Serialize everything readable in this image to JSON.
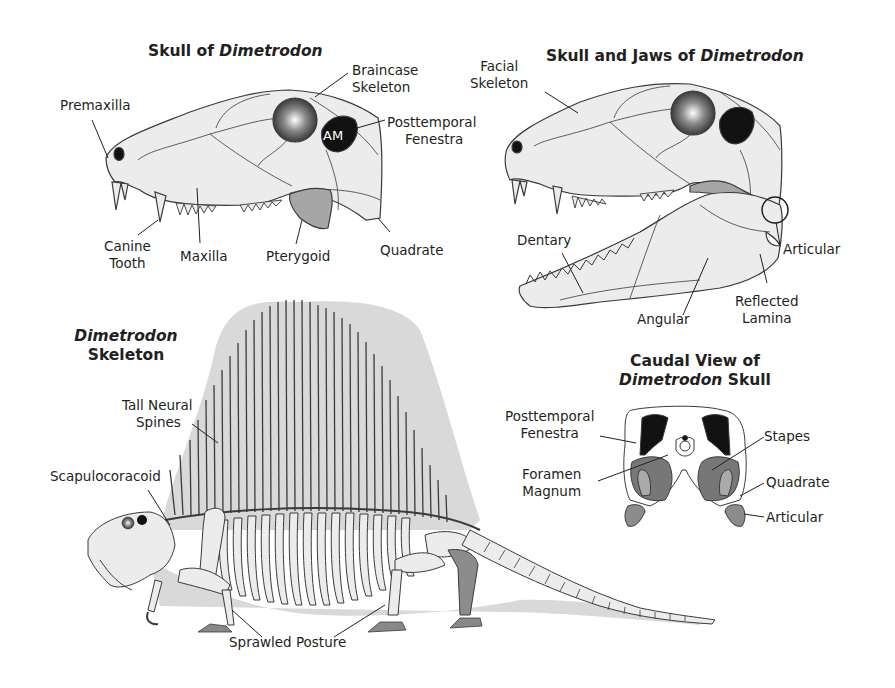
{
  "colors": {
    "background": "#ffffff",
    "bone_fill": "#ececec",
    "outline": "#3a3a3a",
    "sail_fill": "#d9d9d9",
    "fenestra": "#111111",
    "pterygoid_fill": "#a6a6a6",
    "quadrate_fill": "#8c8c8c",
    "dark_bone": "#555555",
    "text": "#231f20"
  },
  "panels": {
    "skull_side": {
      "title_plain": "Skull of ",
      "title_italic": "Dimetrodon",
      "fenestra_label": "AM",
      "labels": {
        "braincase": [
          "Braincase",
          "Skeleton"
        ],
        "premaxilla": "Premaxilla",
        "posttemporal": [
          "Posttemporal",
          "Fenestra"
        ],
        "canine": [
          "Canine",
          "Tooth"
        ],
        "maxilla": "Maxilla",
        "pterygoid": "Pterygoid",
        "quadrate": "Quadrate"
      }
    },
    "skull_jaws": {
      "title_plain": "Skull and Jaws of ",
      "title_italic": "Dimetrodon",
      "labels": {
        "facial": [
          "Facial",
          "Skeleton"
        ],
        "dentary": "Dentary",
        "articular": "Articular",
        "angular": "Angular",
        "reflected_lamina": [
          "Reflected",
          "Lamina"
        ]
      }
    },
    "skeleton": {
      "title_italic": "Dimetrodon",
      "title_plain": "Skeleton",
      "labels": {
        "neural_spines": [
          "Tall Neural",
          "Spines"
        ],
        "scapulocoracoid": "Scapulocoracoid",
        "sprawled": "Sprawled Posture"
      }
    },
    "caudal": {
      "title_line1": "Caudal View of",
      "title_italic": "Dimetrodon",
      "title_plain": " Skull",
      "labels": {
        "posttemporal": [
          "Posttemporal",
          "Fenestra"
        ],
        "foramen": [
          "Foramen",
          "Magnum"
        ],
        "stapes": "Stapes",
        "quadrate": "Quadrate",
        "articular": "Articular"
      }
    }
  }
}
